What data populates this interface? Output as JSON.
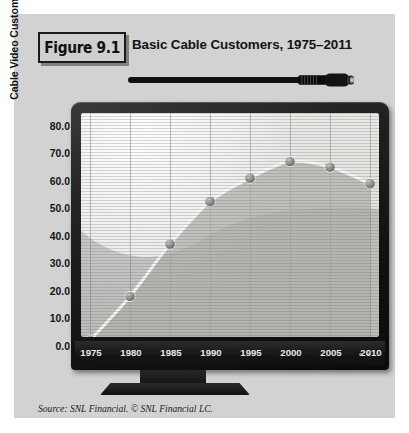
{
  "figure": {
    "badge_label": "Figure 9.1",
    "title": "Basic Cable Customers, 1975–2011",
    "source": "Source: SNL Financial. © SNL Financial LC."
  },
  "colors": {
    "panel_background": "#d2d2d2",
    "page_background": "#ffffff",
    "bezel_dark": "#141414",
    "screen_background": "#cfd0cc",
    "line_color": "#f4f4f2",
    "marker_color": "#8a8a86",
    "area_fill": "#b9bab6",
    "text_dark": "#141414",
    "tick_text_light": "#e8e8e8"
  },
  "chart_data": {
    "type": "line",
    "title": "Basic Cable Customers, 1975–2011",
    "xlabel": "",
    "ylabel": "Cable Video Customers (in millions)",
    "x": [
      1975,
      1980,
      1985,
      1990,
      1995,
      2000,
      2005,
      2010
    ],
    "values": [
      3.5,
      19.5,
      38.5,
      54.0,
      62.5,
      68.5,
      66.5,
      60.5
    ],
    "categories": [
      "1975",
      "1980",
      "1985",
      "1990",
      "1995",
      "2000",
      "2005",
      "2010"
    ],
    "xlim": [
      1975,
      2011
    ],
    "ylim": [
      0,
      80
    ],
    "ytick_labels": [
      "80.0",
      "70.0",
      "60.0",
      "50.0",
      "40.0",
      "30.0",
      "20.0",
      "10.0",
      "0.0"
    ],
    "ytick_values": [
      80,
      70,
      60,
      50,
      40,
      30,
      20,
      10,
      0
    ],
    "xtick_labels": [
      "1975",
      "1980",
      "1985",
      "1990",
      "1995",
      "2000",
      "2005",
      "2010"
    ],
    "grid": "vertical gridlines at each x tick; horizontal CRT scanlines across plot",
    "legend": "none",
    "markers": "filled spherical dots at each data point",
    "series_name": "Basic cable customers"
  },
  "decor": {
    "cable_icon": "coaxial-cable-icon",
    "tv_icon": "crt-television-icon",
    "power_led": "power-indicator-led"
  }
}
